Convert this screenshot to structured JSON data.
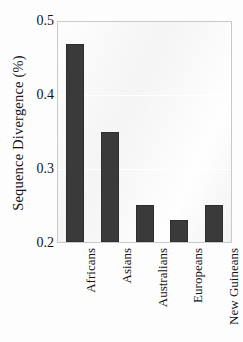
{
  "chart_data": {
    "type": "bar",
    "title": "",
    "xlabel": "",
    "ylabel": "Sequence Divergence (%)",
    "categories": [
      "Africans",
      "Asians",
      "Australians",
      "Europeans",
      "New Guineans"
    ],
    "values": [
      0.47,
      0.35,
      0.25,
      0.23,
      0.25
    ],
    "ylim": [
      0.2,
      0.5
    ],
    "yticks": [
      "0.5",
      "0.4",
      "0.3",
      "0.2"
    ],
    "ytick_values": [
      0.5,
      0.4,
      0.3,
      0.2
    ],
    "grid": true,
    "legend": false,
    "bar_color": "#3a3a3a",
    "plot_background": "#f4f4f4",
    "axis_color": "#c9c9c9"
  },
  "axes": {
    "y_title": "Sequence Divergence (%)"
  }
}
